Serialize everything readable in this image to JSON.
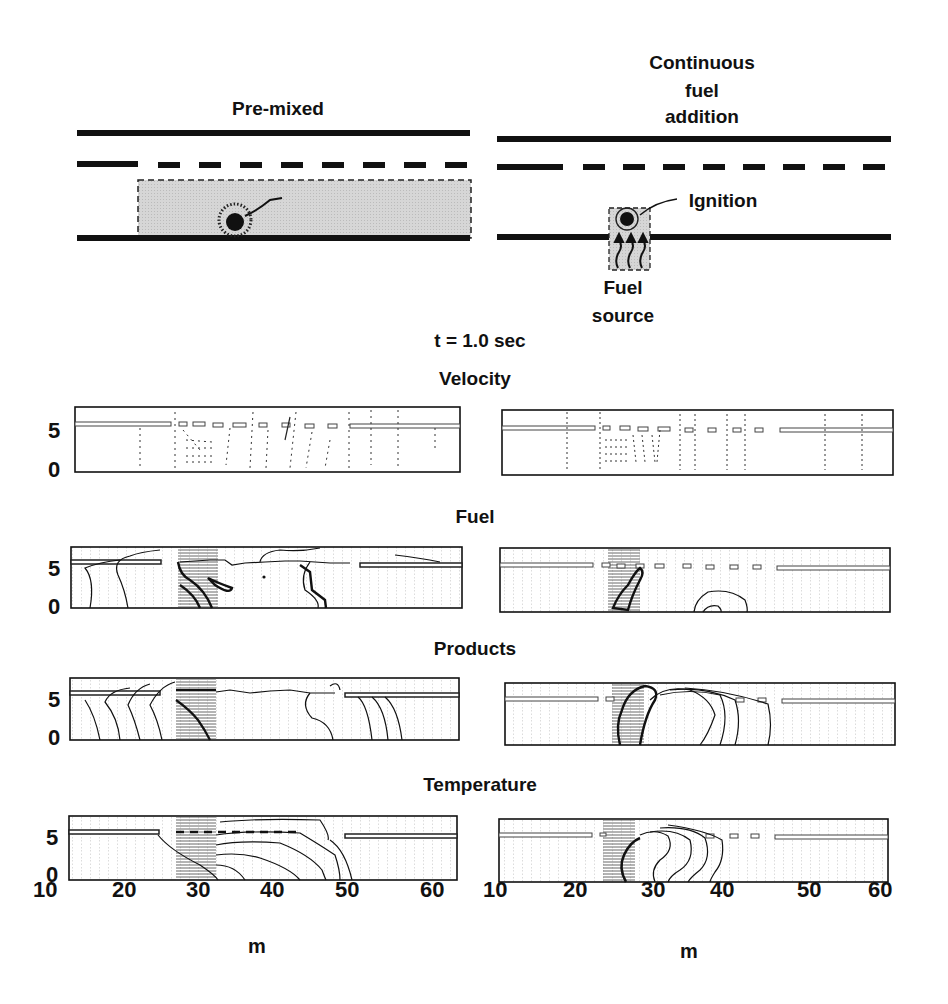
{
  "schematics": {
    "left": {
      "title": "Pre-mixed",
      "ignition_label": "Ignition"
    },
    "right": {
      "title_lines": [
        "Continuous",
        "fuel",
        "addition"
      ],
      "ignition_label": "Ignition",
      "source_lines": [
        "Fuel",
        "source"
      ]
    }
  },
  "time_label": "t = 1.0 sec",
  "panels": [
    {
      "title": "Velocity"
    },
    {
      "title": "Fuel"
    },
    {
      "title": "Products"
    },
    {
      "title": "Temperature"
    }
  ],
  "axes": {
    "y_ticks": [
      "5",
      "0"
    ],
    "x_ticks": [
      "10",
      "20",
      "30",
      "40",
      "50",
      "60"
    ],
    "x_label": "m"
  },
  "colors": {
    "ink": "#111111",
    "shade": "#d9d9d9",
    "grid": "#9a9a9a"
  }
}
